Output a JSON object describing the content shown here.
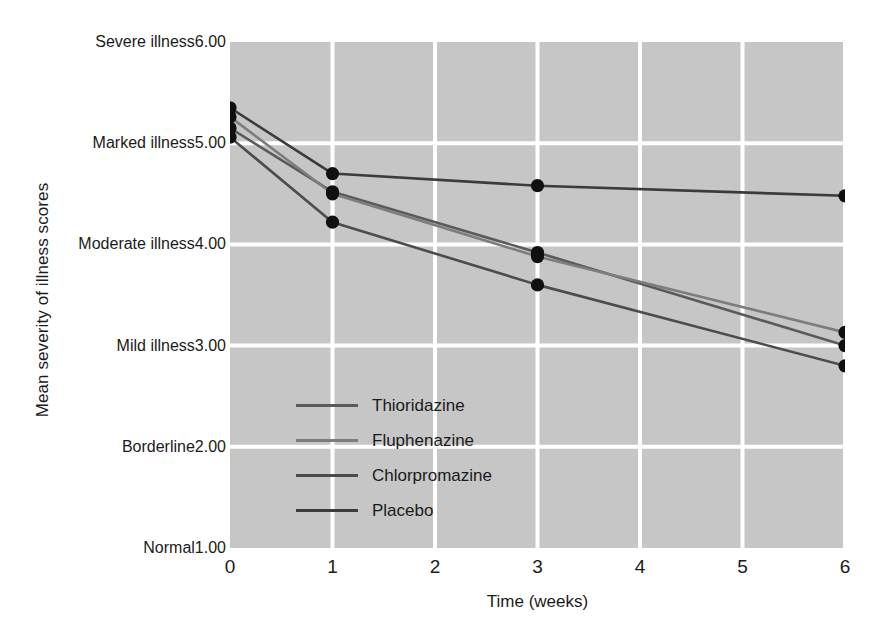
{
  "chart_data": {
    "type": "line",
    "title": "",
    "xlabel": "Time (weeks)",
    "ylabel": "Mean severity of illness scores",
    "xlim": [
      0,
      6
    ],
    "ylim": [
      1,
      6
    ],
    "grid": true,
    "legend_position": "inside-lower-left",
    "x_ticks": [
      "0",
      "1",
      "2",
      "3",
      "4",
      "5",
      "6"
    ],
    "x_tick_values": [
      0,
      1,
      2,
      3,
      4,
      5,
      6
    ],
    "y_ticks": [
      {
        "value": 6,
        "number": "6.00",
        "category": "Severe\nillness"
      },
      {
        "value": 5,
        "number": "5.00",
        "category": "Marked\nillness"
      },
      {
        "value": 4,
        "number": "4.00",
        "category": "Moderate\nillness"
      },
      {
        "value": 3,
        "number": "3.00",
        "category": "Mild\nillness"
      },
      {
        "value": 2,
        "number": "2.00",
        "category": "Borderline"
      },
      {
        "value": 1,
        "number": "1.00",
        "category": "Normal"
      }
    ],
    "x": [
      0,
      1,
      3,
      6
    ],
    "series": [
      {
        "name": "Thioridazine",
        "color": "#5a5a5a",
        "values": [
          5.15,
          4.52,
          3.92,
          3.0
        ]
      },
      {
        "name": "Fluphenazine",
        "color": "#7d7d7d",
        "values": [
          5.26,
          4.5,
          3.88,
          3.13
        ]
      },
      {
        "name": "Chlorpromazine",
        "color": "#4c4c4c",
        "values": [
          5.06,
          4.22,
          3.6,
          2.8
        ]
      },
      {
        "name": "Placebo",
        "color": "#3b3b3b",
        "values": [
          5.35,
          4.7,
          4.58,
          4.48
        ]
      }
    ],
    "marker": "filled-circle",
    "marker_color": "#101010",
    "plot_background": "#c6c6c6",
    "gridline_color": "#ffffff",
    "page_background": "#ffffff"
  }
}
